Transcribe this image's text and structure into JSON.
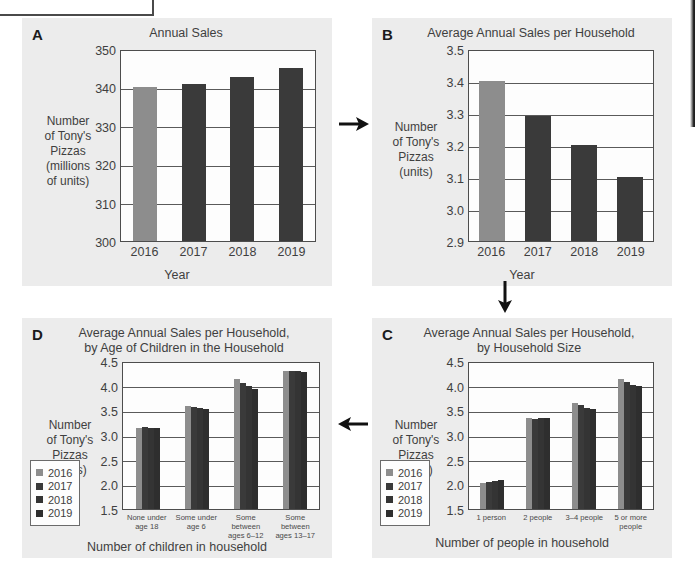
{
  "page": {
    "background": "#ffffff",
    "panel_background": "#ececec",
    "bar_colors": {
      "2016": "#8d8d8d",
      "2017": "#3a3a3a",
      "2018": "#343434",
      "2019": "#2e2e2e"
    }
  },
  "legend_years": [
    "2016",
    "2017",
    "2018",
    "2019"
  ],
  "panels": {
    "A": {
      "letter": "A",
      "title": "Annual Sales",
      "ylabel": "Number\nof Tony's\nPizzas\n(millions\nof units)",
      "ylabel_lines": [
        "Number",
        "of Tony's",
        "Pizzas",
        "(millions",
        "of units)"
      ],
      "xlabel": "Year"
    },
    "B": {
      "letter": "B",
      "title": "Average Annual Sales per Household",
      "ylabel_lines": [
        "Number",
        "of Tony's",
        "Pizzas",
        "(units)"
      ],
      "xlabel": "Year"
    },
    "C": {
      "letter": "C",
      "title_lines": [
        "Average Annual Sales per Household,",
        "by Household Size"
      ],
      "ylabel_lines": [
        "Number",
        "of Tony's",
        "Pizzas",
        "(units)"
      ],
      "xlabel": "Number of people in household"
    },
    "D": {
      "letter": "D",
      "title_lines": [
        "Average Annual Sales per Household,",
        "by Age of Children in the Household"
      ],
      "ylabel_lines": [
        "Number",
        "of Tony's",
        "Pizzas",
        "(units)"
      ],
      "xlabel": "Number of children in household"
    }
  },
  "arrows": {
    "a_to_b": "arrow-right",
    "b_to_c": "arrow-down",
    "c_to_d": "arrow-left"
  },
  "chart_data": [
    {
      "id": "A",
      "type": "bar",
      "title": "Annual Sales",
      "xlabel": "Year",
      "ylabel": "Number of Tony's Pizzas (millions of units)",
      "categories": [
        "2016",
        "2017",
        "2018",
        "2019"
      ],
      "values": [
        340.0,
        340.8,
        342.8,
        345.0
      ],
      "ylim": [
        300,
        350
      ],
      "yticks": [
        300,
        310,
        320,
        330,
        340,
        350
      ],
      "ytick_labels": [
        "300",
        "310",
        "320",
        "330",
        "340",
        "350"
      ],
      "grid": true,
      "legend": false
    },
    {
      "id": "B",
      "type": "bar",
      "title": "Average Annual Sales per Household",
      "xlabel": "Year",
      "ylabel": "Number of Tony's Pizzas (units)",
      "categories": [
        "2016",
        "2017",
        "2018",
        "2019"
      ],
      "values": [
        3.4,
        3.29,
        3.2,
        3.1
      ],
      "ylim": [
        2.9,
        3.5
      ],
      "yticks": [
        2.9,
        3.0,
        3.1,
        3.2,
        3.3,
        3.4,
        3.5
      ],
      "ytick_labels": [
        "2.9",
        "3.0",
        "3.1",
        "3.2",
        "3.3",
        "3.4",
        "3.5"
      ],
      "grid": true,
      "legend": false
    },
    {
      "id": "C",
      "type": "bar",
      "title": "Average Annual Sales per Household, by Household Size",
      "xlabel": "Number of people in household",
      "ylabel": "Number of Tony's Pizzas (units)",
      "categories": [
        "1 person",
        "2 people",
        "3–4 people",
        "5 or more people"
      ],
      "series": [
        {
          "name": "2016",
          "values": [
            2.02,
            3.35,
            3.65,
            4.13
          ]
        },
        {
          "name": "2017",
          "values": [
            2.05,
            3.33,
            3.6,
            4.08
          ]
        },
        {
          "name": "2018",
          "values": [
            2.07,
            3.34,
            3.54,
            4.02
          ]
        },
        {
          "name": "2019",
          "values": [
            2.08,
            3.34,
            3.52,
            3.99
          ]
        }
      ],
      "ylim": [
        1.5,
        4.5
      ],
      "yticks": [
        1.5,
        2.0,
        2.5,
        3.0,
        3.5,
        4.0,
        4.5
      ],
      "ytick_labels": [
        "1.5",
        "2.0",
        "2.5",
        "3.0",
        "3.5",
        "4.0",
        "4.5"
      ],
      "grid": true,
      "legend": true,
      "legend_position": "left-outside"
    },
    {
      "id": "D",
      "type": "bar",
      "title": "Average Annual Sales per Household, by Age of Children in the Household",
      "xlabel": "Number of children in household",
      "ylabel": "Number of Tony's Pizzas (units)",
      "categories": [
        "None under age 18",
        "Some under age 6",
        "Some between ages 6–12",
        "Some between ages 13–17"
      ],
      "category_lines": [
        [
          "None under",
          "age 18"
        ],
        [
          "Some under",
          "age 6"
        ],
        [
          "Some between",
          "ages 6–12"
        ],
        [
          "Some between",
          "ages 13–17"
        ]
      ],
      "series": [
        {
          "name": "2016",
          "values": [
            3.14,
            3.59,
            4.13,
            4.3
          ]
        },
        {
          "name": "2017",
          "values": [
            3.16,
            3.57,
            4.06,
            4.3
          ]
        },
        {
          "name": "2018",
          "values": [
            3.15,
            3.54,
            3.99,
            4.29
          ]
        },
        {
          "name": "2019",
          "values": [
            3.14,
            3.52,
            3.94,
            4.27
          ]
        }
      ],
      "ylim": [
        1.5,
        4.5
      ],
      "yticks": [
        1.5,
        2.0,
        2.5,
        3.0,
        3.5,
        4.0,
        4.5
      ],
      "ytick_labels": [
        "1.5",
        "2.0",
        "2.5",
        "3.0",
        "3.5",
        "4.0",
        "4.5"
      ],
      "grid": true,
      "legend": true,
      "legend_position": "left-outside"
    }
  ]
}
